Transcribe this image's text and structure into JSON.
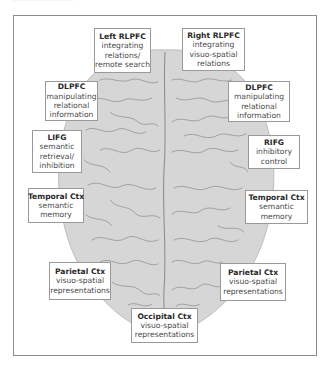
{
  "diagram": {
    "type": "brain-region-map",
    "view": "dorsal (top-down) view of brain",
    "colors": {
      "brain_fill": "#d6d6d6",
      "sulci": "#9b9b9b",
      "frame": "#8c8c8c",
      "box_border": "#9a9a9a",
      "box_fill": "#ffffff",
      "title_text": "#2a2a2a",
      "body_text": "#4a4a4a"
    },
    "regions": [
      {
        "id": "left-rlpfc",
        "title": "Left RLPFC",
        "lines": [
          "integrating",
          "relations/",
          "remote search"
        ],
        "side": "left"
      },
      {
        "id": "right-rlpfc",
        "title": "Right RLPFC",
        "lines": [
          "integrating",
          "visuo-spatial",
          "relations"
        ],
        "side": "right"
      },
      {
        "id": "left-dlpfc",
        "title": "DLPFC",
        "lines": [
          "manipulating",
          "relational",
          "information"
        ],
        "side": "left"
      },
      {
        "id": "right-dlpfc",
        "title": "DLPFC",
        "lines": [
          "manipulating",
          "relational",
          "information"
        ],
        "side": "right"
      },
      {
        "id": "lifg",
        "title": "LIFG",
        "lines": [
          "semantic",
          "retrieval/",
          "inhibition"
        ],
        "side": "left"
      },
      {
        "id": "rifg",
        "title": "RIFG",
        "lines": [
          "inhibitory",
          "control"
        ],
        "side": "right"
      },
      {
        "id": "left-temporal",
        "title": "Temporal Ctx",
        "lines": [
          "semantic",
          "memory"
        ],
        "side": "left"
      },
      {
        "id": "right-temporal",
        "title": "Temporal Ctx",
        "lines": [
          "semantic",
          "memory"
        ],
        "side": "right"
      },
      {
        "id": "left-parietal",
        "title": "Parietal Ctx",
        "lines": [
          "visuo-spatial",
          "representations"
        ],
        "side": "left"
      },
      {
        "id": "right-parietal",
        "title": "Parietal Ctx",
        "lines": [
          "visuo-spatial",
          "representations"
        ],
        "side": "right"
      },
      {
        "id": "occipital",
        "title": "Occipital Ctx",
        "lines": [
          "visuo-spatial",
          "representations"
        ],
        "side": "center"
      }
    ]
  }
}
